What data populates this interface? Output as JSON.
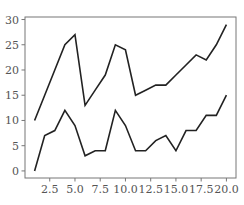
{
  "chart_data": {
    "type": "line",
    "title": "",
    "xlabel": "",
    "ylabel": "",
    "x": [
      1,
      2,
      3,
      4,
      5,
      6,
      7,
      8,
      9,
      10,
      11,
      12,
      13,
      14,
      15,
      16,
      17,
      18,
      19,
      20
    ],
    "series": [
      {
        "name": "upper",
        "values": [
          10,
          15,
          20,
          25,
          27,
          13,
          16,
          19,
          25,
          24,
          15,
          16,
          17,
          17,
          19,
          21,
          23,
          22,
          25,
          29
        ]
      },
      {
        "name": "lower",
        "values": [
          0,
          7,
          8,
          12,
          9,
          3,
          4,
          4,
          12,
          9,
          4,
          4,
          6,
          7,
          4,
          8,
          8,
          11,
          11,
          15
        ]
      }
    ],
    "xlim": [
      0.05,
      20.95
    ],
    "ylim": [
      -1.4,
      30.5
    ],
    "xticks": [
      2.5,
      5.0,
      7.5,
      10.0,
      12.5,
      15.0,
      17.5,
      20.0
    ],
    "xtick_labels": [
      "2.5",
      "5.0",
      "7.5",
      "10.0",
      "12.5",
      "15.0",
      "17.5",
      "20.0"
    ],
    "yticks": [
      0,
      5,
      10,
      15,
      20,
      25,
      30
    ],
    "ytick_labels": [
      "0",
      "5",
      "10",
      "15",
      "20",
      "25",
      "30"
    ],
    "grid": false,
    "legend": null,
    "line_color": "#222222",
    "frame_color": "#777777"
  }
}
